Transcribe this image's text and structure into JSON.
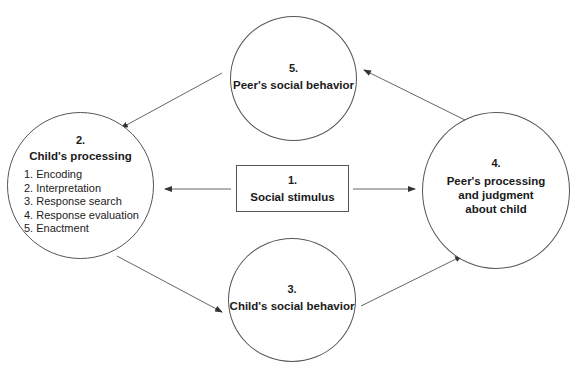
{
  "diagram": {
    "nodes": [
      {
        "id": "n1",
        "number": "1.",
        "title": "Social stimulus",
        "shape": "box"
      },
      {
        "id": "n2",
        "number": "2.",
        "title": "Child's processing",
        "shape": "circle",
        "steps": [
          "1. Encoding",
          "2. Interpretation",
          "3. Response search",
          "4. Response evaluation",
          "5. Enactment"
        ]
      },
      {
        "id": "n3",
        "number": "3.",
        "title": "Child's social behavior",
        "shape": "circle"
      },
      {
        "id": "n4",
        "number": "4.",
        "title_lines": [
          "Peer's processing",
          "and judgment",
          "about child"
        ],
        "shape": "circle"
      },
      {
        "id": "n5",
        "number": "5.",
        "title": "Peer's social behavior",
        "shape": "circle"
      }
    ],
    "edges": [
      {
        "from": "n1",
        "to": "n2"
      },
      {
        "from": "n1",
        "to": "n4"
      },
      {
        "from": "n2",
        "to": "n3"
      },
      {
        "from": "n3",
        "to": "n4"
      },
      {
        "from": "n4",
        "to": "n5"
      },
      {
        "from": "n5",
        "to": "n2"
      }
    ],
    "line_color": "#555555"
  }
}
